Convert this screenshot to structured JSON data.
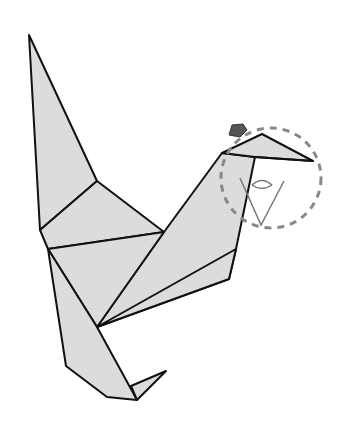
{
  "diagram": {
    "title": "Origami bird folding step",
    "colors": {
      "paper": "#dcdcdc",
      "outline": "#111111",
      "dashed_circle": "#888888",
      "eye_marker": "#555555",
      "eye_symbol": "#777777",
      "background": "#ffffff"
    },
    "annotations": [
      {
        "type": "dashed-circle",
        "label": "head detail highlight"
      },
      {
        "type": "eye-symbol",
        "label": "view point"
      },
      {
        "type": "pentagon-marker",
        "label": "head marker"
      }
    ]
  }
}
